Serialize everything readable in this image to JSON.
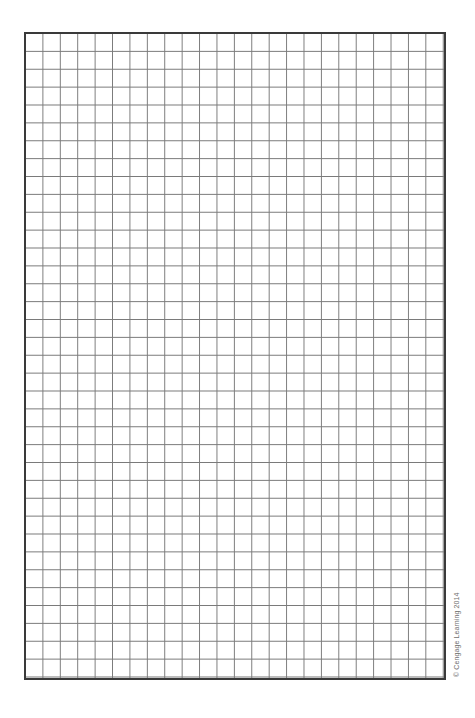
{
  "graph_paper": {
    "columns": 24,
    "rows": 36,
    "grid_line_color": "#7a7a7a",
    "border_color": "#3a3a3a"
  },
  "footer": {
    "copyright": "© Cengage Learning 2014"
  }
}
